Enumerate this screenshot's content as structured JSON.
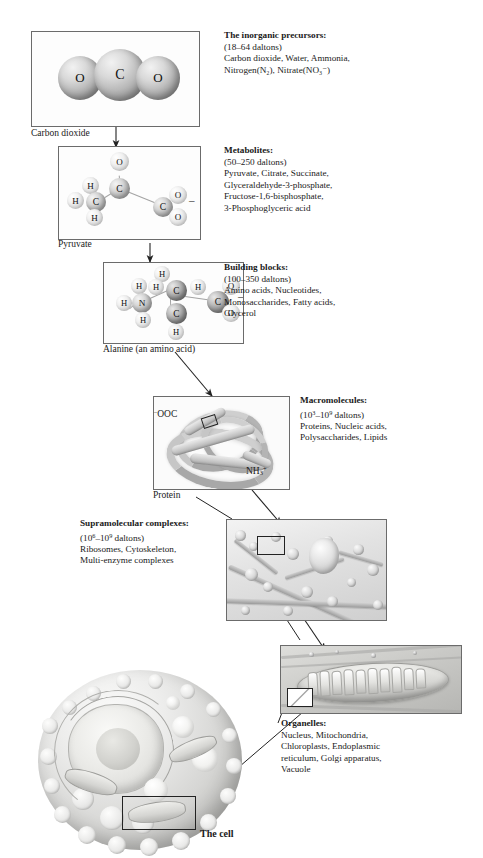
{
  "figure": {
    "bottom_label": "The cell"
  },
  "levels": [
    {
      "id": "inorganic-precursors",
      "panel_caption": "Carbon dioxide",
      "heading": "The inorganic precursors:",
      "mass_range": "(18–64 daltons)",
      "examples": [
        "Carbon dioxide, Water, Ammonia,",
        "Nitrogen(N₂), Nitrate(NO₃⁻)"
      ],
      "molecule": {
        "name": "carbon-dioxide",
        "atoms": [
          "O",
          "C",
          "O"
        ]
      }
    },
    {
      "id": "metabolites",
      "panel_caption": "Pyruvate",
      "heading": "Metabolites:",
      "mass_range": "(50–250 daltons)",
      "examples": [
        "Pyruvate, Citrate, Succinate,",
        "Glyceraldehyde-3-phosphate,",
        "Fructose-1,6-bisphosphate,",
        "3-Phosphoglyceric acid"
      ],
      "molecule": {
        "name": "pyruvate",
        "atoms": [
          "O",
          "C",
          "H",
          "H",
          "C",
          "H",
          "C",
          "O",
          "O"
        ],
        "charge": "–"
      }
    },
    {
      "id": "building-blocks",
      "panel_caption": "Alanine  (an amino acid)",
      "heading": "Building blocks:",
      "mass_range": "(100–350 daltons)",
      "examples": [
        "Amino acids, Nucleotides,",
        "Monosaccharides, Fatty acids,",
        "Glycerol"
      ],
      "molecule": {
        "name": "alanine",
        "atoms": [
          "H",
          "H",
          "H",
          "N",
          "H",
          "C",
          "H",
          "C",
          "C",
          "O",
          "O"
        ],
        "charge": "–"
      }
    },
    {
      "id": "macromolecules",
      "panel_caption": "Protein",
      "heading": "Macromolecules:",
      "mass_range": "(10³–10⁹ daltons)",
      "mass_base_1": "10",
      "mass_exp_1": "3",
      "mass_base_2": "10",
      "mass_exp_2": "9",
      "mass_suffix": " daltons)",
      "mass_prefix": "(",
      "examples": [
        "Proteins, Nucleic acids,",
        "Polysaccharides, Lipids"
      ],
      "labels": {
        "n_terminus": "OOC",
        "n_terminus_charge": "–",
        "c_terminus": "NH",
        "c_terminus_sub": "3",
        "c_terminus_sup": "+"
      }
    },
    {
      "id": "supramolecular-complexes",
      "panel_caption": "",
      "heading": "Supramolecular complexes:",
      "mass_prefix": "(",
      "mass_base_1": "10",
      "mass_exp_1": "6",
      "mass_base_2": "10",
      "mass_exp_2": "9",
      "mass_suffix": " daltons)",
      "examples": [
        "Ribosomes, Cytoskeleton,",
        "Multi-enzyme complexes"
      ]
    },
    {
      "id": "organelles",
      "panel_caption": "",
      "heading": "Organelles:",
      "examples": [
        "Nucleus, Mitochondria,",
        "Chloroplasts, Endoplasmic",
        "reticulum, Golgi apparatus,",
        "Vacuole"
      ]
    }
  ],
  "colors": {
    "panel_border": "#6b6b6b",
    "text": "#1a1a1a",
    "arrow": "#222222",
    "page_background": "#ffffff"
  }
}
